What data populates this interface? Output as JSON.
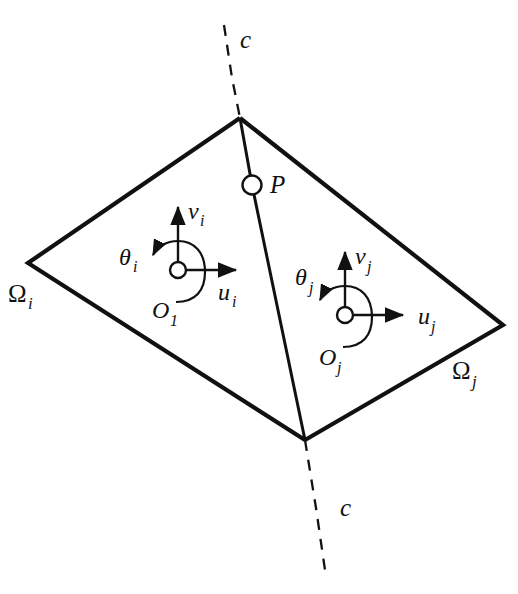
{
  "figure": {
    "background_color": "#ffffff",
    "line_color": "#111111"
  },
  "labels": {
    "interface_curve_top": "c",
    "interface_curve_bottom": "c",
    "interface_node": "P",
    "domain_left": "Ω",
    "domain_left_sub": "i",
    "domain_right": "Ω",
    "domain_right_sub": "j",
    "frame_i": {
      "origin": "O",
      "origin_sub": "1",
      "axis_u": "u",
      "axis_u_sub": "i",
      "axis_v": "v",
      "axis_v_sub": "i",
      "rotation": "θ",
      "rotation_sub": "i"
    },
    "frame_j": {
      "origin": "O",
      "origin_sub": "j",
      "axis_u": "u",
      "axis_u_sub": "j",
      "axis_v": "v",
      "axis_v_sub": "j",
      "rotation": "θ",
      "rotation_sub": "j"
    }
  },
  "geometry": {
    "vertex_top": [
      240,
      118
    ],
    "vertex_left": [
      28,
      263
    ],
    "vertex_bottom": [
      305,
      440
    ],
    "vertex_right": [
      503,
      325
    ],
    "node_p": [
      252,
      185
    ],
    "origin_i": [
      178,
      270
    ],
    "origin_j": [
      345,
      315
    ],
    "dashed_top_start": [
      224,
      25
    ],
    "dashed_bottom_end": [
      325,
      570
    ],
    "origin_radius": 7,
    "arc_radius": 22,
    "axis_length_u": 52,
    "axis_length_v": 48
  }
}
